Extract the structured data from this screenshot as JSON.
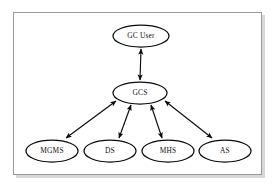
{
  "diagram": {
    "frame": {
      "name": "diagram-border",
      "x": 13,
      "y": 12,
      "width": 249,
      "height": 163,
      "stroke": "#9a9a9a",
      "fill": "#ffffff"
    },
    "style": {
      "node_fill": "#ffffff",
      "node_stroke": "#0a0a0a",
      "label_color": "#111111",
      "connector_color": "#0a0a0a",
      "background": "#ffffff"
    },
    "nodes": [
      {
        "id": "gc-user",
        "label": "GC User",
        "shape": "ellipse",
        "cx": 141,
        "cy": 36,
        "rx": 28,
        "ry": 11,
        "level": "top"
      },
      {
        "id": "gcs",
        "label": "GCS",
        "shape": "ellipse",
        "cx": 140,
        "cy": 93,
        "rx": 27,
        "ry": 11,
        "level": "middle"
      },
      {
        "id": "mgms",
        "label": "MGMS",
        "shape": "ellipse",
        "cx": 52,
        "cy": 151,
        "rx": 26,
        "ry": 11,
        "level": "bottom"
      },
      {
        "id": "ds",
        "label": "DS",
        "shape": "ellipse",
        "cx": 110,
        "cy": 151,
        "rx": 26,
        "ry": 11,
        "level": "bottom"
      },
      {
        "id": "mhs",
        "label": "MHS",
        "shape": "ellipse",
        "cx": 168,
        "cy": 151,
        "rx": 26,
        "ry": 11,
        "level": "bottom"
      },
      {
        "id": "as",
        "label": "AS",
        "shape": "ellipse",
        "cx": 225,
        "cy": 151,
        "rx": 26,
        "ry": 11,
        "level": "bottom"
      }
    ],
    "edges": [
      {
        "id": "edge-gcuser-gcs",
        "from": "gc-user",
        "to": "gcs",
        "arrow": "double",
        "x1": 141,
        "y1": 48,
        "x2": 140,
        "y2": 81
      },
      {
        "id": "edge-gcs-mgms",
        "from": "gcs",
        "to": "mgms",
        "arrow": "double",
        "x1": 117,
        "y1": 100,
        "x2": 65,
        "y2": 139
      },
      {
        "id": "edge-gcs-ds",
        "from": "gcs",
        "to": "ds",
        "arrow": "double",
        "x1": 130,
        "y1": 104,
        "x2": 118,
        "y2": 139
      },
      {
        "id": "edge-gcs-mhs",
        "from": "gcs",
        "to": "mhs",
        "arrow": "double",
        "x1": 152,
        "y1": 104,
        "x2": 163,
        "y2": 139
      },
      {
        "id": "edge-gcs-as",
        "from": "gcs",
        "to": "as",
        "arrow": "double",
        "x1": 164,
        "y1": 100,
        "x2": 213,
        "y2": 139
      }
    ]
  }
}
